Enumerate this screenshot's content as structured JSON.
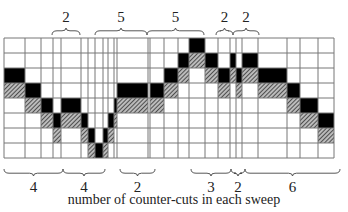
{
  "caption": "number of counter-cuts in each sweep",
  "colors": {
    "line": "#777777",
    "black": "#000000",
    "hatch_fg": "#333333",
    "hatch_bg": "#bbbbbb",
    "text": "#222222"
  },
  "grid": {
    "top": 38,
    "row_height": 15,
    "rows": 8,
    "col_edges": [
      4,
      25,
      41,
      53,
      61,
      81,
      88,
      95,
      103,
      108,
      114,
      117,
      148,
      150,
      164,
      178,
      189,
      205,
      218,
      230,
      236,
      242,
      258,
      287,
      300,
      318,
      334
    ],
    "cells": [
      {
        "row": 0,
        "x0": 189,
        "x1": 205,
        "fill": "black"
      },
      {
        "row": 1,
        "x0": 178,
        "x1": 189,
        "fill": "black"
      },
      {
        "row": 1,
        "x0": 189,
        "x1": 205,
        "fill": "hatch"
      },
      {
        "row": 1,
        "x0": 205,
        "x1": 218,
        "fill": "black"
      },
      {
        "row": 1,
        "x0": 230,
        "x1": 236,
        "fill": "black"
      },
      {
        "row": 1,
        "x0": 242,
        "x1": 258,
        "fill": "black"
      },
      {
        "row": 2,
        "x0": 4,
        "x1": 25,
        "fill": "black"
      },
      {
        "row": 2,
        "x0": 164,
        "x1": 178,
        "fill": "black"
      },
      {
        "row": 2,
        "x0": 178,
        "x1": 189,
        "fill": "hatch"
      },
      {
        "row": 2,
        "x0": 205,
        "x1": 218,
        "fill": "hatch"
      },
      {
        "row": 2,
        "x0": 218,
        "x1": 230,
        "fill": "black"
      },
      {
        "row": 2,
        "x0": 230,
        "x1": 236,
        "fill": "hatch"
      },
      {
        "row": 2,
        "x0": 236,
        "x1": 242,
        "fill": "black"
      },
      {
        "row": 2,
        "x0": 242,
        "x1": 258,
        "fill": "hatch"
      },
      {
        "row": 2,
        "x0": 258,
        "x1": 287,
        "fill": "black"
      },
      {
        "row": 3,
        "x0": 4,
        "x1": 25,
        "fill": "hatch"
      },
      {
        "row": 3,
        "x0": 25,
        "x1": 41,
        "fill": "black"
      },
      {
        "row": 3,
        "x0": 117,
        "x1": 148,
        "fill": "black"
      },
      {
        "row": 3,
        "x0": 150,
        "x1": 164,
        "fill": "black"
      },
      {
        "row": 3,
        "x0": 164,
        "x1": 178,
        "fill": "hatch"
      },
      {
        "row": 3,
        "x0": 218,
        "x1": 230,
        "fill": "hatch"
      },
      {
        "row": 3,
        "x0": 236,
        "x1": 242,
        "fill": "hatch"
      },
      {
        "row": 3,
        "x0": 258,
        "x1": 287,
        "fill": "hatch"
      },
      {
        "row": 3,
        "x0": 287,
        "x1": 300,
        "fill": "black"
      },
      {
        "row": 4,
        "x0": 25,
        "x1": 41,
        "fill": "hatch"
      },
      {
        "row": 4,
        "x0": 41,
        "x1": 53,
        "fill": "black"
      },
      {
        "row": 4,
        "x0": 61,
        "x1": 81,
        "fill": "black"
      },
      {
        "row": 4,
        "x0": 114,
        "x1": 117,
        "fill": "black"
      },
      {
        "row": 4,
        "x0": 117,
        "x1": 148,
        "fill": "hatch"
      },
      {
        "row": 4,
        "x0": 150,
        "x1": 164,
        "fill": "hatch"
      },
      {
        "row": 4,
        "x0": 287,
        "x1": 300,
        "fill": "hatch"
      },
      {
        "row": 4,
        "x0": 300,
        "x1": 318,
        "fill": "black"
      },
      {
        "row": 5,
        "x0": 41,
        "x1": 53,
        "fill": "hatch"
      },
      {
        "row": 5,
        "x0": 53,
        "x1": 61,
        "fill": "black"
      },
      {
        "row": 5,
        "x0": 61,
        "x1": 81,
        "fill": "hatch"
      },
      {
        "row": 5,
        "x0": 81,
        "x1": 88,
        "fill": "black"
      },
      {
        "row": 5,
        "x0": 108,
        "x1": 114,
        "fill": "black"
      },
      {
        "row": 5,
        "x0": 114,
        "x1": 117,
        "fill": "hatch"
      },
      {
        "row": 5,
        "x0": 300,
        "x1": 318,
        "fill": "hatch"
      },
      {
        "row": 5,
        "x0": 318,
        "x1": 334,
        "fill": "black"
      },
      {
        "row": 6,
        "x0": 53,
        "x1": 61,
        "fill": "hatch"
      },
      {
        "row": 6,
        "x0": 81,
        "x1": 88,
        "fill": "hatch"
      },
      {
        "row": 6,
        "x0": 88,
        "x1": 95,
        "fill": "black"
      },
      {
        "row": 6,
        "x0": 103,
        "x1": 108,
        "fill": "black"
      },
      {
        "row": 6,
        "x0": 108,
        "x1": 114,
        "fill": "hatch"
      },
      {
        "row": 6,
        "x0": 318,
        "x1": 334,
        "fill": "hatch"
      },
      {
        "row": 7,
        "x0": 88,
        "x1": 95,
        "fill": "hatch"
      },
      {
        "row": 7,
        "x0": 95,
        "x1": 103,
        "fill": "black"
      },
      {
        "row": 7,
        "x0": 103,
        "x1": 108,
        "fill": "hatch"
      }
    ]
  },
  "top_braces": [
    {
      "x0": 52,
      "x1": 80,
      "label": "2"
    },
    {
      "x0": 95,
      "x1": 147,
      "label": "5"
    },
    {
      "x0": 147,
      "x1": 204,
      "label": "5"
    },
    {
      "x0": 216,
      "x1": 233,
      "label": "2"
    },
    {
      "x0": 233,
      "x1": 259,
      "label": "2"
    }
  ],
  "bottom_braces": [
    {
      "x0": 4,
      "x1": 63,
      "label": "4"
    },
    {
      "x0": 63,
      "x1": 105,
      "label": "4"
    },
    {
      "x0": 120,
      "x1": 155,
      "label": "2"
    },
    {
      "x0": 191,
      "x1": 231,
      "label": "3"
    },
    {
      "x0": 231,
      "x1": 245,
      "label": "2"
    },
    {
      "x0": 245,
      "x1": 340,
      "label": "6"
    }
  ]
}
